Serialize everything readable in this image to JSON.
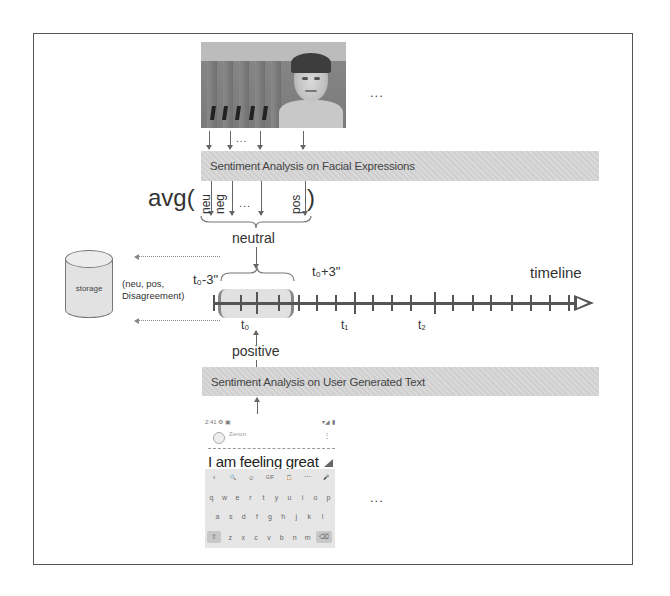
{
  "diagram": {
    "top_ellipsis": "...",
    "bottom_ellipsis": "...",
    "frame_arrows_ellipsis": "...",
    "facial_box": {
      "label": "Sentiment Analysis on Facial Expressions"
    },
    "text_box": {
      "label": "Sentiment Analysis on User Generated Text"
    },
    "avg": {
      "prefix": "avg(",
      "suffix": ")",
      "items": [
        "neu",
        "neg",
        "...",
        "pos"
      ]
    },
    "face_result": "neutral",
    "text_result": "positive",
    "storage": {
      "label": "storage",
      "record": "(neu, pos, Disagreement)"
    },
    "timeline": {
      "label": "timeline",
      "window_start": "t₀-3\"",
      "window_end": "t₀+3\"",
      "marks": [
        "t₀",
        "t₁",
        "t₂"
      ]
    },
    "phone": {
      "status_left": "2:41 ⚙ ▣",
      "status_right": "▾◢ ▮",
      "contact_name": "Zenon",
      "menu_icon": "⋮",
      "message": "I am feeling great",
      "keyboard": {
        "toolbar": [
          "‹",
          "🔍",
          "☺",
          "GIF",
          "📋",
          "⋯",
          "🎤"
        ],
        "row1": [
          "q",
          "w",
          "e",
          "r",
          "t",
          "y",
          "u",
          "i",
          "o",
          "p"
        ],
        "row2": [
          "a",
          "s",
          "d",
          "f",
          "g",
          "h",
          "j",
          "k",
          "l"
        ],
        "row3": [
          "⇧",
          "z",
          "x",
          "c",
          "v",
          "b",
          "n",
          "m",
          "⌫"
        ]
      }
    }
  }
}
